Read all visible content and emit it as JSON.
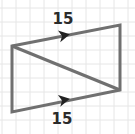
{
  "diagram": {
    "type": "parallelogram-with-diagonal",
    "colors": {
      "background": "#ffffff",
      "grid": "#e6e6e6",
      "stroke": "#707070",
      "label": "#2b2b2b"
    },
    "grid_spacing": 14,
    "vertices": {
      "top_left": [
        12,
        46
      ],
      "top_right": [
        120,
        25
      ],
      "bottom_right": [
        120,
        90
      ],
      "bottom_left": [
        12,
        112
      ]
    },
    "sides": {
      "top": {
        "label": "15",
        "parallel_marker": "arrow-right"
      },
      "bottom": {
        "label": "15",
        "parallel_marker": "arrow-right"
      }
    },
    "diagonal": "top_left-to-bottom_right"
  }
}
